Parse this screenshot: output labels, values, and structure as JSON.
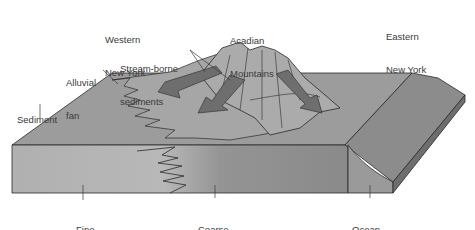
{
  "diagram": {
    "type": "block-diagram",
    "labels": {
      "western_ny": [
        "Western",
        "New York"
      ],
      "acadian": [
        "Acadian",
        "Mountains"
      ],
      "eastern_ny": [
        "Eastern",
        "New York"
      ],
      "stream": [
        "Stream-borne",
        "sediments"
      ],
      "alluvial": [
        "Alluvial",
        "fan"
      ],
      "sediment": [
        "Sediment"
      ],
      "fine": [
        "Fine",
        "sediment"
      ],
      "coarse": [
        "Coarse",
        "sediment"
      ],
      "ocean": [
        "Ocean",
        "basin"
      ]
    },
    "colors": {
      "top_surface": "#9a9a9a",
      "front_fine": "#b4b4b4",
      "front_coarse": "#8c8c8c",
      "ocean_top": "#8a8a8a",
      "ocean_front": "#7a7a7a",
      "mountain": "#a8a8a8",
      "arrow": "#6e6e6e",
      "outline": "#2a2a2a",
      "text": "#3a3a3a"
    }
  }
}
